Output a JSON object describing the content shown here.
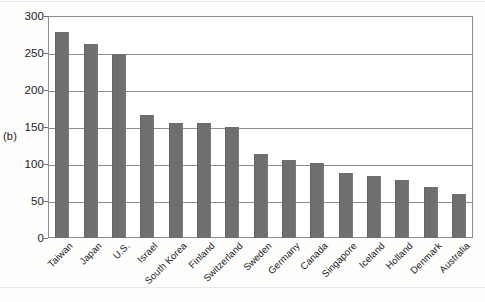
{
  "figure": {
    "panel_letter": "(b)",
    "bar_color": "#6f6f6f",
    "frame_color": "#8d8d8d",
    "background": "#ffffff"
  },
  "chart_data": {
    "type": "bar",
    "title": "",
    "xlabel": "",
    "ylabel": "",
    "ylim": [
      0,
      300
    ],
    "yticks": [
      0,
      50,
      100,
      150,
      200,
      250,
      300
    ],
    "ytick_labels": [
      "0",
      "50",
      "100",
      "150",
      "200",
      "250",
      "300"
    ],
    "grid": true,
    "legend": "none",
    "categories": [
      "Taiwan",
      "Japan",
      "U.S.",
      "Israel",
      "South Korea",
      "Finland",
      "Switzerland",
      "Sweden",
      "Germany",
      "Canada",
      "Singapore",
      "Iceland",
      "Holland",
      "Denmark",
      "Australia"
    ],
    "values": [
      278,
      262,
      249,
      166,
      155,
      155,
      150,
      113,
      105,
      101,
      88,
      84,
      79,
      69,
      59
    ]
  }
}
